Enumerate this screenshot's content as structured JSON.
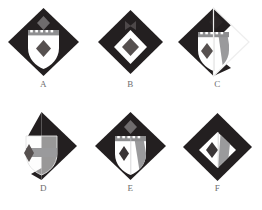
{
  "page": {
    "background_color": "#ffffff",
    "width": 262,
    "height": 210,
    "rows": 2,
    "columns": 3
  },
  "palette": {
    "dark": "#231f20",
    "dark_alt": "#2b2627",
    "gray": "#8e8e90",
    "gray_light": "#b9b9bb",
    "white": "#ffffff",
    "label_text": "#6d6d6d",
    "faint": "#efefef"
  },
  "figures": [
    {
      "id": "A",
      "label": "A",
      "shape": "full-diamond",
      "description": "Dark diamond containing a white shield with a crenellated chief and a gray lozenge; a gray lozenge sits above the shield near the diamond apex.",
      "diamond": "full",
      "diamond_fill": "dark",
      "shield": "whole",
      "shield_fill": "white",
      "chief": "crenellated",
      "chief_fill": "gray",
      "charge": "lozenge",
      "charge_fill": "gray",
      "charge_position": "center",
      "band": "none",
      "top_lozenge": true,
      "top_lozenge_fill": "gray"
    },
    {
      "id": "B",
      "label": "B",
      "shape": "full-diamond",
      "description": "Dark diamond containing a white diamond voided with a gray lozenge at centre; a small dark bowtie mark sits near the apex.",
      "diamond": "full",
      "diamond_fill": "dark",
      "shield": "none",
      "shield_fill": "white",
      "chief": "none",
      "chief_fill": "gray",
      "charge": "lozenge",
      "charge_fill": "gray",
      "charge_position": "center",
      "band": "none",
      "top_lozenge": false,
      "inner_diamond": true,
      "inner_diamond_fill": "white",
      "apex_mark": "bowtie"
    },
    {
      "id": "C",
      "label": "C",
      "shape": "half-diamond-left",
      "description": "Left half of the dark diamond only; white shield with crenellated chief bears a gray lozenge on the left and a gray bend on the right.",
      "diamond": "left-half",
      "diamond_fill": "dark",
      "shield": "whole",
      "shield_fill": "white",
      "chief": "crenellated",
      "chief_fill": "gray",
      "charge": "lozenge",
      "charge_fill": "gray",
      "charge_position": "left",
      "band": "bend-sinister",
      "band_fill": "gray",
      "top_lozenge": true,
      "top_lozenge_fill": "dark"
    },
    {
      "id": "D",
      "label": "D",
      "shape": "right-triangle",
      "description": "Right half of the dark diamond forming a triangle; a pale outlined shield on the left carries a gray lozenge and a gray fess.",
      "diamond": "right-half",
      "diamond_fill": "dark",
      "shield": "outline",
      "shield_fill": "faint",
      "chief": "none",
      "chief_fill": "gray",
      "charge": "lozenge",
      "charge_fill": "gray",
      "charge_position": "left",
      "band": "fess",
      "band_fill": "gray",
      "top_lozenge": false
    },
    {
      "id": "E",
      "label": "E",
      "shape": "full-diamond",
      "description": "Dark diamond containing a white shield with a crenellated chief, a dark lozenge on the left and a gray bend on the right; a gray lozenge sits above the shield.",
      "diamond": "full",
      "diamond_fill": "dark",
      "shield": "whole",
      "shield_fill": "white",
      "chief": "crenellated",
      "chief_fill": "gray",
      "charge": "lozenge",
      "charge_fill": "dark",
      "charge_position": "left",
      "band": "bend-sinister",
      "band_fill": "gray",
      "top_lozenge": true,
      "top_lozenge_fill": "gray"
    },
    {
      "id": "F",
      "label": "F",
      "shape": "full-diamond",
      "description": "Dark diamond with a white inner diamond bearing a dark lozenge on the left and a gray bend on the right.",
      "diamond": "full",
      "diamond_fill": "dark",
      "shield": "none",
      "shield_fill": "white",
      "chief": "none",
      "chief_fill": "gray",
      "charge": "lozenge",
      "charge_fill": "dark",
      "charge_position": "left",
      "band": "bend-sinister",
      "band_fill": "gray",
      "top_lozenge": false,
      "inner_diamond": true,
      "inner_diamond_fill": "white"
    }
  ]
}
